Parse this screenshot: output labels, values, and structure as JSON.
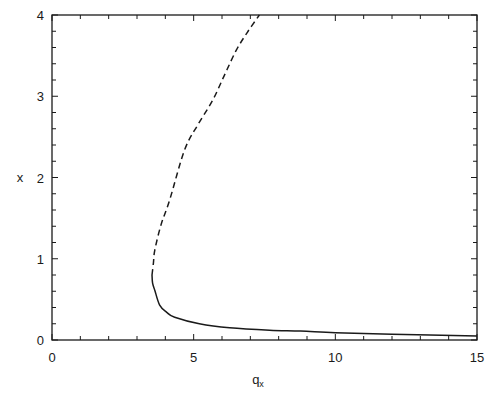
{
  "chart_data": {
    "type": "line",
    "title": "",
    "xlabel": "q_x",
    "xlabel_main": "q",
    "xlabel_sub": "x",
    "ylabel": "x",
    "xlim": [
      0,
      15
    ],
    "ylim": [
      0,
      4
    ],
    "xticks": [
      0,
      5,
      10,
      15
    ],
    "yticks": [
      0,
      1,
      2,
      3,
      4
    ],
    "x_minor_step": 1,
    "y_minor_step": 0.2,
    "grid": false,
    "legend": null,
    "series": [
      {
        "name": "upper branch (dashed)",
        "style": "dashed",
        "color": "#1a1a1a",
        "points": [
          [
            3.53,
            0.8
          ],
          [
            3.58,
            0.95
          ],
          [
            3.63,
            1.11
          ],
          [
            3.85,
            1.42
          ],
          [
            4.15,
            1.72
          ],
          [
            4.68,
            2.34
          ],
          [
            5.15,
            2.65
          ],
          [
            5.67,
            2.95
          ],
          [
            6.1,
            3.27
          ],
          [
            6.51,
            3.57
          ],
          [
            6.92,
            3.8
          ],
          [
            7.32,
            4.0
          ]
        ]
      },
      {
        "name": "lower branch (solid)",
        "style": "solid",
        "color": "#1a1a1a",
        "points": [
          [
            3.53,
            0.8
          ],
          [
            3.55,
            0.7
          ],
          [
            3.63,
            0.61
          ],
          [
            3.8,
            0.43
          ],
          [
            4.05,
            0.34
          ],
          [
            4.33,
            0.28
          ],
          [
            5.2,
            0.2
          ],
          [
            6.27,
            0.15
          ],
          [
            7.68,
            0.12
          ],
          [
            8.77,
            0.11
          ],
          [
            10.0,
            0.09
          ],
          [
            12.0,
            0.07
          ],
          [
            15.0,
            0.05
          ]
        ]
      }
    ]
  },
  "plot_area": {
    "left": 52,
    "top": 15,
    "right": 477,
    "bottom": 340
  }
}
